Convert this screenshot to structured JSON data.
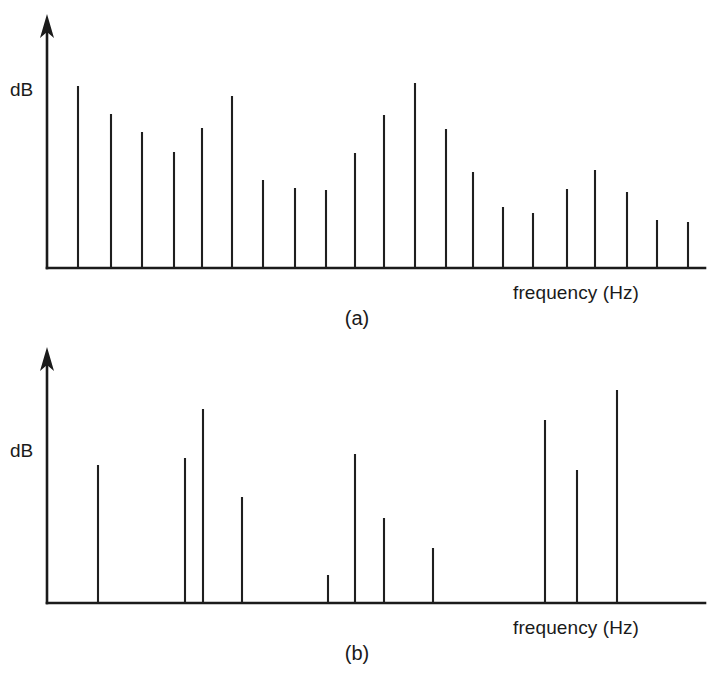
{
  "figure": {
    "background_color": "#ffffff",
    "ink_color": "#1b1b1b",
    "width": 718,
    "height": 673
  },
  "panel_a": {
    "caption": "(a)",
    "ylabel": "dB",
    "xlabel": "frequency (Hz)",
    "axis": {
      "origin_x": 47,
      "baseline_y": 268,
      "y_top": 22,
      "x_right": 705
    },
    "ylabel_pos": {
      "x": 10,
      "y": 96
    },
    "xlabel_pos": {
      "x": 513,
      "y": 299
    },
    "caption_pos": {
      "x": 357,
      "y": 325
    }
  },
  "panel_b": {
    "caption": "(b)",
    "ylabel": "dB",
    "xlabel": "frequency (Hz)",
    "axis": {
      "origin_x": 47,
      "baseline_y": 270,
      "y_top": 22,
      "x_right": 705
    },
    "ylabel_pos": {
      "x": 10,
      "y": 124
    },
    "xlabel_pos": {
      "x": 513,
      "y": 301
    },
    "caption_pos": {
      "x": 357,
      "y": 327
    }
  },
  "chart_data": [
    {
      "type": "bar",
      "id": "panel-a",
      "title": "(a)",
      "xlabel": "frequency (Hz)",
      "ylabel": "dB",
      "grid": false,
      "legend": "none",
      "axis_style": "arrowed-axes-no-ticks",
      "note": "Harmonic line spectrum with densely spaced spectral lines (22 partials).",
      "x_pixels": [
        78,
        111,
        142,
        174,
        202,
        232,
        263,
        295,
        326,
        355,
        384,
        415,
        446,
        473,
        503,
        533,
        567,
        595,
        627,
        657,
        688
      ],
      "top_pixels": [
        86,
        114,
        132,
        152,
        128,
        96,
        180,
        188,
        190,
        153,
        115,
        83,
        129,
        172,
        207,
        213,
        189,
        170,
        192,
        220,
        222
      ],
      "baseline_pixel": 268,
      "values_relative_dB": [
        75.0,
        63.6,
        55.3,
        47.2,
        57.0,
        70.0,
        35.8,
        32.5,
        31.7,
        46.7,
        62.2,
        75.2,
        56.5,
        39.0,
        24.8,
        22.4,
        32.1,
        39.8,
        30.9,
        19.5,
        18.7
      ],
      "ylim": [
        0,
        100
      ],
      "series": [
        {
          "name": "spectrum (a)",
          "values": [
            75.0,
            63.6,
            55.3,
            47.2,
            57.0,
            70.0,
            35.8,
            32.5,
            31.7,
            46.7,
            62.2,
            75.2,
            56.5,
            39.0,
            24.8,
            22.4,
            32.1,
            39.8,
            30.9,
            19.5,
            18.7
          ]
        }
      ]
    },
    {
      "type": "bar",
      "id": "panel-b",
      "title": "(b)",
      "xlabel": "frequency (Hz)",
      "ylabel": "dB",
      "grid": false,
      "legend": "none",
      "axis_style": "arrowed-axes-no-ticks",
      "note": "Sparse inharmonic line spectrum with 12 widely spaced spectral lines.",
      "x_pixels": [
        98,
        185,
        203,
        242,
        328,
        355,
        384,
        433,
        545,
        577,
        617
      ],
      "top_pixels": [
        465,
        458,
        409,
        497,
        575,
        454,
        518,
        548,
        420,
        470,
        390
      ],
      "baseline_pixel": 603,
      "values_relative_dB": [
        40.2,
        42.0,
        54.2,
        31.6,
        8.3,
        43.0,
        26.0,
        16.2,
        54.8,
        42.3,
        62.0
      ],
      "ylim": [
        0,
        100
      ],
      "series": [
        {
          "name": "spectrum (b)",
          "values": [
            40.2,
            42.0,
            54.2,
            31.6,
            8.3,
            43.0,
            26.0,
            16.2,
            54.8,
            42.3,
            62.0
          ]
        }
      ]
    }
  ]
}
